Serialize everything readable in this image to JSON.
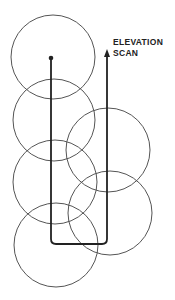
{
  "diagram": {
    "label_line1": "ELEVATION",
    "label_line2": "SCAN",
    "colors": {
      "background": "#ffffff",
      "circle_stroke": "#555555",
      "path_stroke": "#222222"
    },
    "circles": [
      {
        "cx": 53,
        "cy": 57,
        "r": 42
      },
      {
        "cx": 54,
        "cy": 120,
        "r": 41
      },
      {
        "cx": 108,
        "cy": 150,
        "r": 42
      },
      {
        "cx": 55,
        "cy": 182,
        "r": 42
      },
      {
        "cx": 110,
        "cy": 213,
        "r": 42
      },
      {
        "cx": 56,
        "cy": 245,
        "r": 42
      }
    ],
    "scan_path": {
      "start": [
        51,
        58
      ],
      "corner_left": [
        52,
        244
      ],
      "corner_right": [
        107,
        244
      ],
      "end_arrow": [
        107,
        50
      ]
    }
  }
}
